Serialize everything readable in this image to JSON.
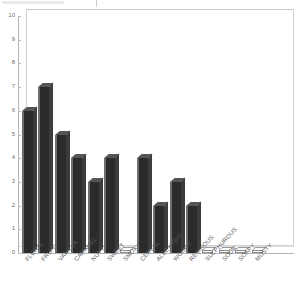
{
  "chart_data": {
    "type": "bar",
    "title": "",
    "subtitle": "",
    "xlabel": "",
    "ylabel": "",
    "ylim": [
      0,
      10
    ],
    "yticks": [
      0,
      1,
      2,
      3,
      4,
      5,
      6,
      7,
      8,
      9,
      10
    ],
    "grid": false,
    "legend": null,
    "style": "3d-bars",
    "bar_color": "#2b2b2b",
    "axis_color": "#b5b5b5",
    "categories": [
      "FLORAL",
      "FRUITY",
      "VANILLA",
      "CARAMEL",
      "NUTTY",
      "SWEET",
      "SMOKY",
      "CEREAL",
      "ALDEHYDIC",
      "WOODY",
      "RESINOUS",
      "SULPHUROUS",
      "SOUR",
      "SOAPY",
      "MUSTY"
    ],
    "values": [
      6,
      7,
      5,
      4,
      3,
      4,
      0,
      4,
      2,
      3,
      2,
      0,
      0,
      0,
      0
    ]
  },
  "notes": {
    "last_label_truncated": "MUSTY"
  }
}
